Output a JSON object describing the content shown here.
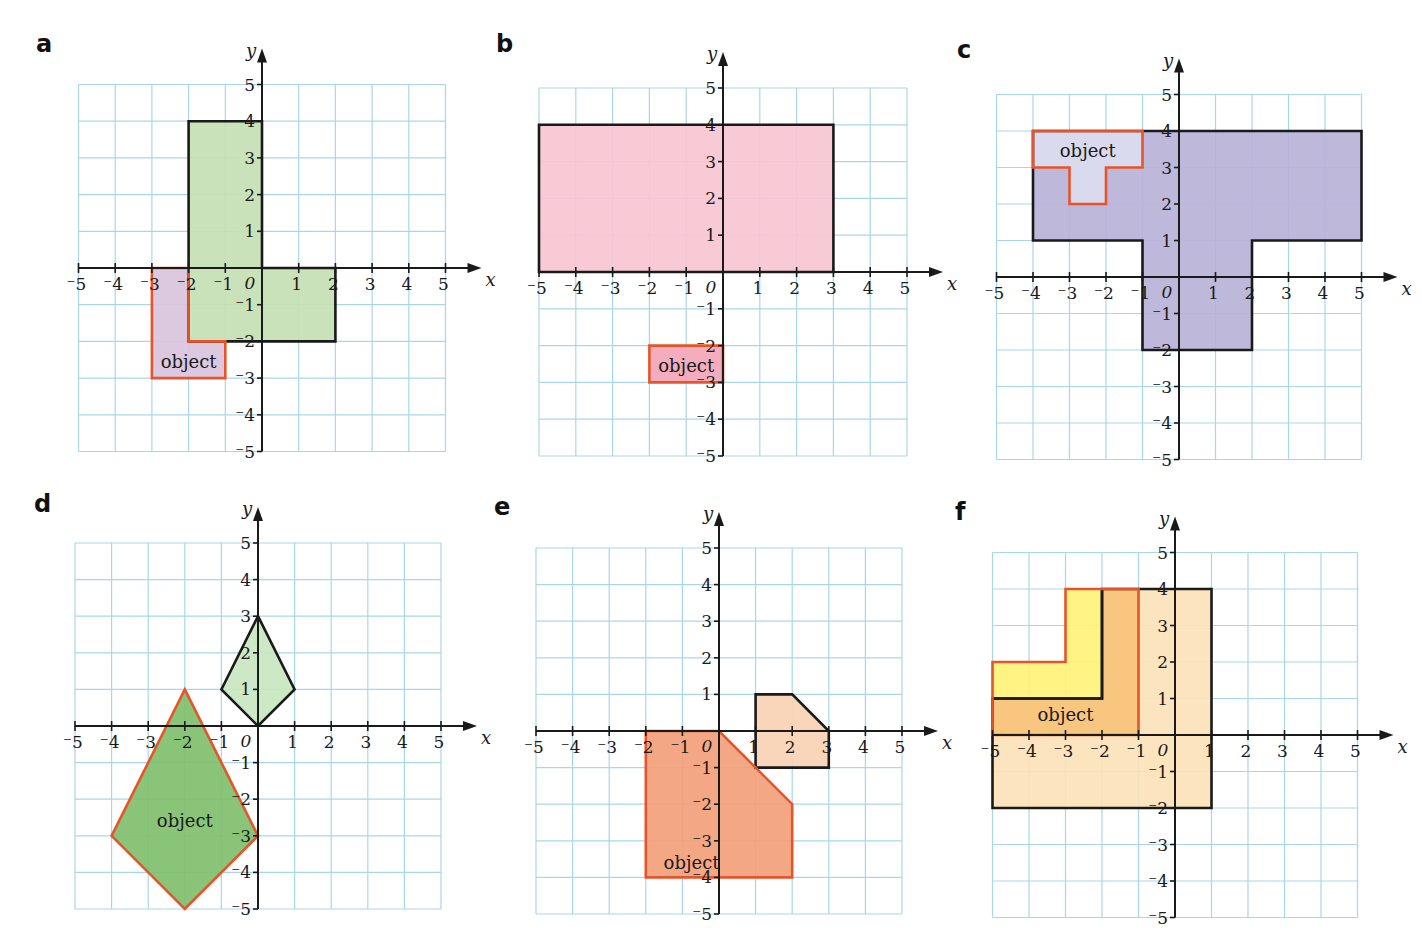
{
  "colors": {
    "grid": "#a9d6ea",
    "axis": "#1a1a1a",
    "object_stroke": "#e8542a",
    "image_stroke": "#1a1a1a",
    "text": "#1a1a1a"
  },
  "axis_labels": {
    "x": "x",
    "y": "y",
    "origin": "0"
  },
  "object_label": "object",
  "tick_range": [
    -5,
    5
  ],
  "panels": [
    {
      "letter": "a",
      "letter_pos": [
        38,
        52
      ],
      "grid": {
        "left": 79,
        "top": 78,
        "cell": 36.7
      },
      "origin": [
        262,
        268
      ],
      "shapes": [
        {
          "role": "image",
          "fill": "#c5e0b4",
          "points": [
            [
              -2,
              4
            ],
            [
              0,
              4
            ],
            [
              0,
              0
            ],
            [
              2,
              0
            ],
            [
              2,
              -2
            ],
            [
              -2,
              -2
            ]
          ]
        },
        {
          "role": "object",
          "fill": "#d9c3dc",
          "points": [
            [
              -3,
              0
            ],
            [
              -2,
              0
            ],
            [
              -2,
              -2
            ],
            [
              -1,
              -2
            ],
            [
              -1,
              -3
            ],
            [
              -3,
              -3
            ]
          ]
        },
        {
          "role": "object-overlap",
          "fill": "#c5e0b4",
          "points": [
            [
              -2,
              0
            ],
            [
              -2,
              -2
            ]
          ]
        }
      ],
      "object_label_pos": [
        -2,
        -2.55
      ]
    },
    {
      "letter": "b",
      "letter_pos": [
        498,
        52
      ],
      "grid": {
        "left": 539,
        "top": 82,
        "cell": 36.8
      },
      "origin": [
        723,
        272
      ],
      "shapes": [
        {
          "role": "image",
          "fill": "#f7c6d3",
          "points": [
            [
              -5,
              4
            ],
            [
              3,
              4
            ],
            [
              3,
              0
            ],
            [
              -5,
              0
            ]
          ]
        },
        {
          "role": "object",
          "fill": "#f2a6b8",
          "points": [
            [
              -2,
              -2
            ],
            [
              0,
              -2
            ],
            [
              0,
              -3
            ],
            [
              -2,
              -3
            ]
          ]
        }
      ],
      "object_label_pos": [
        -1,
        -2.55
      ]
    },
    {
      "letter": "c",
      "letter_pos": [
        958,
        58
      ],
      "grid": {
        "left": 997,
        "top": 88,
        "cell": 36.5
      },
      "origin": [
        1179,
        277
      ],
      "shapes": [
        {
          "role": "image",
          "fill": "#b8b3d8",
          "points": [
            [
              -4,
              4
            ],
            [
              5,
              4
            ],
            [
              5,
              1
            ],
            [
              2,
              1
            ],
            [
              2,
              -2
            ],
            [
              -1,
              -2
            ],
            [
              -1,
              1
            ],
            [
              -4,
              1
            ]
          ]
        },
        {
          "role": "object",
          "fill": "#dcdcf0",
          "points": [
            [
              -4,
              4
            ],
            [
              -1,
              4
            ],
            [
              -1,
              3
            ],
            [
              -2,
              3
            ],
            [
              -2,
              2
            ],
            [
              -3,
              2
            ],
            [
              -3,
              3
            ],
            [
              -4,
              3
            ]
          ]
        }
      ],
      "object_label_pos": [
        -2.5,
        3.45
      ]
    },
    {
      "letter": "d",
      "letter_pos": [
        36,
        512
      ],
      "grid": {
        "left": 75,
        "top": 538,
        "cell": 36.6
      },
      "origin": [
        258,
        726
      ],
      "shapes": [
        {
          "role": "image",
          "fill": "#c8e6c0",
          "points": [
            [
              0,
              3
            ],
            [
              1,
              1
            ],
            [
              0,
              0
            ],
            [
              -1,
              1
            ]
          ]
        },
        {
          "role": "object",
          "fill": "#7fbf6e",
          "points": [
            [
              -2,
              1
            ],
            [
              0,
              -3
            ],
            [
              -2,
              -5
            ],
            [
              -4,
              -3
            ]
          ]
        }
      ],
      "object_label_pos": [
        -2,
        -2.6
      ]
    },
    {
      "letter": "e",
      "letter_pos": [
        496,
        515
      ],
      "grid": {
        "left": 536,
        "top": 543,
        "cell": 36.6
      },
      "origin": [
        719,
        731
      ],
      "shapes": [
        {
          "role": "image",
          "fill": "#f8d2b4",
          "points": [
            [
              1,
              1
            ],
            [
              2,
              1
            ],
            [
              3,
              0
            ],
            [
              3,
              -1
            ],
            [
              1,
              -1
            ]
          ]
        },
        {
          "role": "object",
          "fill": "#f3a07a",
          "points": [
            [
              -2,
              0
            ],
            [
              0,
              0
            ],
            [
              2,
              -2
            ],
            [
              2,
              -4
            ],
            [
              -2,
              -4
            ]
          ]
        }
      ],
      "object_label_pos": [
        -0.75,
        -3.6
      ]
    },
    {
      "letter": "f",
      "letter_pos": [
        956,
        520
      ],
      "grid": {
        "left": 993,
        "top": 546,
        "cell": 36.5
      },
      "origin": [
        1175,
        735
      ],
      "shapes": [
        {
          "role": "image",
          "fill": "#fbe2b8",
          "points": [
            [
              -5,
              1
            ],
            [
              -2,
              1
            ],
            [
              -2,
              4
            ],
            [
              1,
              4
            ],
            [
              1,
              -2
            ],
            [
              -5,
              -2
            ]
          ]
        },
        {
          "role": "object",
          "fill": "#fff27a",
          "points": [
            [
              -5,
              2
            ],
            [
              -3,
              2
            ],
            [
              -3,
              4
            ],
            [
              -1,
              4
            ],
            [
              -1,
              0
            ],
            [
              -5,
              0
            ]
          ]
        },
        {
          "role": "overlap",
          "fill": "#f7c27e",
          "points": [
            [
              -5,
              1
            ],
            [
              -2,
              1
            ],
            [
              -2,
              4
            ],
            [
              -1,
              4
            ],
            [
              -1,
              0
            ],
            [
              -5,
              0
            ]
          ]
        }
      ],
      "inner_lines": [
        [
          [
            -5,
            1
          ],
          [
            -2,
            1
          ],
          [
            -2,
            4
          ]
        ]
      ],
      "object_label_pos": [
        -3,
        0.55
      ]
    }
  ]
}
